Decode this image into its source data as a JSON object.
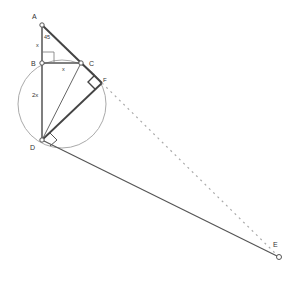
{
  "diagram": {
    "points": {
      "A": {
        "label": "A",
        "x": 42,
        "y": 25
      },
      "B": {
        "label": "B",
        "x": 42,
        "y": 63
      },
      "C": {
        "label": "C",
        "x": 81,
        "y": 63
      },
      "F": {
        "label": "F",
        "x": 102,
        "y": 83
      },
      "D": {
        "label": "D",
        "x": 42,
        "y": 140
      },
      "E": {
        "label": "E",
        "x": 279,
        "y": 257
      }
    },
    "annotations": {
      "angle_A": "45",
      "AB": "x",
      "BC": "x",
      "BD": "2x"
    },
    "circle": {
      "cx": 62,
      "cy": 104,
      "r": 44
    },
    "colors": {
      "line": "#555555",
      "thick_line": "#444444",
      "circle": "#aaaaaa",
      "dotted": "#aaaaaa"
    }
  }
}
